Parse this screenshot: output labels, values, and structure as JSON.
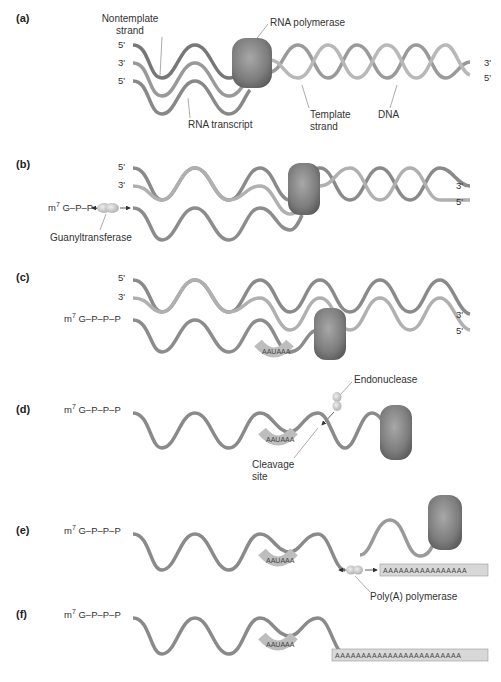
{
  "figure": {
    "panels": [
      {
        "id": "a",
        "label": "(a)"
      },
      {
        "id": "b",
        "label": "(b)"
      },
      {
        "id": "c",
        "label": "(c)"
      },
      {
        "id": "d",
        "label": "(d)"
      },
      {
        "id": "e",
        "label": "(e)"
      },
      {
        "id": "f",
        "label": "(f)"
      }
    ],
    "strand_ends": {
      "five_prime": "5'",
      "three_prime": "3'"
    },
    "cap": {
      "prefix": "m",
      "superscript": "7",
      "rest": " G–P–P–P"
    },
    "labels": {
      "nontemplate_strand_line1": "Nontemplate",
      "nontemplate_strand_line2": "strand",
      "rna_polymerase": "RNA polymerase",
      "rna_transcript": "RNA transcript",
      "template_strand_line1": "Template",
      "template_strand_line2": "strand",
      "dna": "DNA",
      "guanyltransferase": "Guanyltransferase",
      "endonuclease": "Endonuclease",
      "cleavage_site_line1": "Cleavage",
      "cleavage_site_line2": "site",
      "polya_polymerase": "Poly(A) polymerase"
    },
    "signal_sequence": "AAUAAA",
    "polya_tail_e": "AAAAAAAAAAAAAAAA",
    "polya_tail_f": "AAAAAAAAAAAAAAAAAAAAAAAA",
    "colors": {
      "strand_dark": "#6e6e6e",
      "strand_light": "#b5b5b5",
      "polymerase": "#7a7a7a",
      "enzyme": "#c8c8c8",
      "tail_box": "#d8d8d8"
    }
  }
}
